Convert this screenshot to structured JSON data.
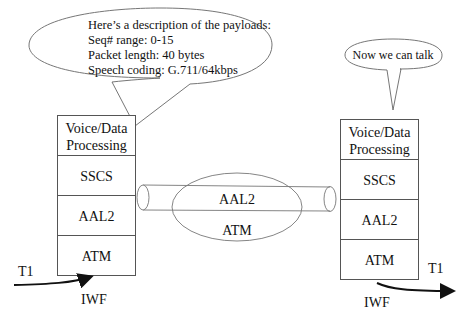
{
  "left_callout": {
    "heading": "Here’s a description of the payloads:",
    "lines": [
      "Seq# range: 0-15",
      "Packet length: 40 bytes",
      "Speech coding: G.711/64kbps"
    ]
  },
  "right_callout": {
    "text": "Now we can talk"
  },
  "left_stack": {
    "layers": [
      {
        "line1": "Voice/Data",
        "line2": "Processing"
      },
      {
        "line1": "SSCS"
      },
      {
        "line1": "AAL2"
      },
      {
        "line1": "ATM"
      }
    ],
    "input_label": "T1",
    "node_label": "IWF"
  },
  "right_stack": {
    "layers": [
      {
        "line1": "Voice/Data",
        "line2": "Processing"
      },
      {
        "line1": "SSCS"
      },
      {
        "line1": "AAL2"
      },
      {
        "line1": "ATM"
      }
    ],
    "output_label": "T1",
    "node_label": "IWF"
  },
  "connection": {
    "pipe_label": "AAL2",
    "ellipse_label": "ATM"
  },
  "colors": {
    "stroke": "#555555",
    "text": "#111111",
    "background": "#ffffff"
  }
}
